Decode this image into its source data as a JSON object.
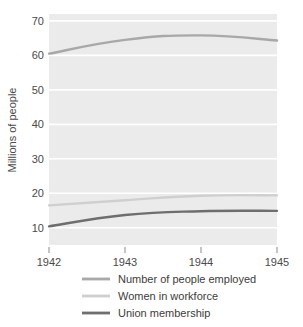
{
  "chart_data": {
    "type": "line",
    "title": "",
    "xlabel": "",
    "ylabel": "Millions of people",
    "x": [
      1942,
      1943,
      1944,
      1945
    ],
    "xtick_labels": [
      "1942",
      "1943",
      "1944",
      "1945"
    ],
    "ytick_labels": [
      "10",
      "20",
      "30",
      "40",
      "50",
      "60",
      "70"
    ],
    "yticks": [
      10,
      20,
      30,
      40,
      50,
      60,
      70
    ],
    "ylim": [
      5,
      72
    ],
    "xlim": [
      1942,
      1945
    ],
    "grid": true,
    "grid_color": "#ffffff",
    "plot_background": "#ebebeb",
    "legend_position": "bottom",
    "series": [
      {
        "name": "Number of people employed",
        "color": "#a8a8a8",
        "values": [
          60.5,
          64.5,
          65.8,
          64.3
        ]
      },
      {
        "name": "Women in workforce",
        "color": "#cfcfcf",
        "values": [
          16.5,
          18.0,
          19.3,
          19.4
        ]
      },
      {
        "name": "Union membership",
        "color": "#6e6e6e",
        "values": [
          10.4,
          13.7,
          14.8,
          14.9
        ]
      }
    ]
  },
  "axis": {
    "y_title": "Millions of people",
    "y_ticks": [
      {
        "label": "70",
        "value": 70
      },
      {
        "label": "60",
        "value": 60
      },
      {
        "label": "50",
        "value": 50
      },
      {
        "label": "40",
        "value": 40
      },
      {
        "label": "30",
        "value": 30
      },
      {
        "label": "20",
        "value": 20
      },
      {
        "label": "10",
        "value": 10
      }
    ],
    "x_ticks": [
      {
        "label": "1942",
        "value": 1942
      },
      {
        "label": "1943",
        "value": 1943
      },
      {
        "label": "1944",
        "value": 1944
      },
      {
        "label": "1945",
        "value": 1945
      }
    ]
  },
  "legend": {
    "entries": [
      {
        "label": "Number of people employed",
        "color": "#a8a8a8"
      },
      {
        "label": "Women in workforce",
        "color": "#cfcfcf"
      },
      {
        "label": "Union membership",
        "color": "#6e6e6e"
      }
    ]
  },
  "colors": {
    "plot_bg": "#ebebeb",
    "grid": "#ffffff",
    "text": "#4a4a4a",
    "employed": "#a8a8a8",
    "women": "#cfcfcf",
    "union": "#6e6e6e"
  }
}
